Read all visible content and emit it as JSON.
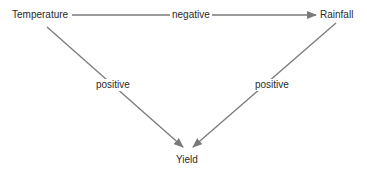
{
  "diagram": {
    "nodes": [
      {
        "id": "temperature",
        "label": "Temperature"
      },
      {
        "id": "rainfall",
        "label": "Rainfall"
      },
      {
        "id": "yield",
        "label": "Yield"
      }
    ],
    "edges": [
      {
        "from": "temperature",
        "to": "rainfall",
        "label": "negative"
      },
      {
        "from": "temperature",
        "to": "yield",
        "label": "positive"
      },
      {
        "from": "rainfall",
        "to": "yield",
        "label": "positive"
      }
    ],
    "colors": {
      "arrow": "#7a7a7a",
      "text": "#2a2a2a",
      "background": "#ffffff"
    }
  }
}
